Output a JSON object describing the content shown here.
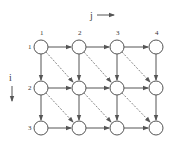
{
  "diagram": {
    "axis_j": {
      "label": "j"
    },
    "axis_i": {
      "label": "i"
    },
    "column_labels": [
      "1",
      "2",
      "3",
      "4"
    ],
    "row_labels": [
      "1",
      "2",
      "3"
    ],
    "grid": {
      "rows": 3,
      "cols": 4
    },
    "edges": {
      "horizontal": "solid arrows from (i,j) to (i,j+1)",
      "vertical": "solid arrows from (i,j) to (i+1,j)",
      "diagonal": "dashed arrows from (i,j) to (i+1,j+1)"
    },
    "colors": {
      "stroke": "#555555",
      "node_fill": "#ffffff",
      "dashed": "#666666"
    }
  }
}
